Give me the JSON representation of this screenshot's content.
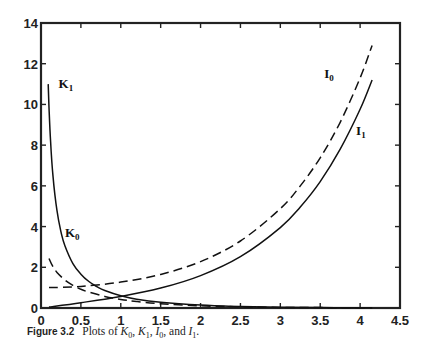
{
  "chart_data": {
    "type": "line",
    "title": "",
    "xlabel": "",
    "ylabel": "",
    "xlim": [
      0,
      4.5
    ],
    "ylim": [
      0,
      14
    ],
    "grid": false,
    "legend": "inline labels",
    "xticks": [
      0,
      0.5,
      1,
      1.5,
      2,
      2.5,
      3,
      3.5,
      4,
      4.5
    ],
    "xtick_labels": [
      "0",
      "0.5",
      "1",
      "1.5",
      "2",
      "2.5",
      "3",
      "3.5",
      "4",
      "4.5"
    ],
    "yticks": [
      0,
      2,
      4,
      6,
      8,
      10,
      12,
      14
    ],
    "ytick_labels": [
      "0",
      "2",
      "4",
      "6",
      "8",
      "10",
      "12",
      "14"
    ],
    "series": [
      {
        "name": "K1",
        "label_main": "K",
        "label_sub": "1",
        "style": "solid",
        "label_pos": [
          0.22,
          10.8
        ],
        "x": [
          0.09,
          0.1,
          0.12,
          0.15,
          0.2,
          0.25,
          0.3,
          0.4,
          0.5,
          0.6,
          0.7,
          0.8,
          1.0,
          1.2,
          1.5,
          2.0,
          2.5,
          3.0,
          3.5,
          4.0,
          4.15
        ],
        "values": [
          11.0,
          9.85,
          8.18,
          6.48,
          4.78,
          3.75,
          3.06,
          2.18,
          1.66,
          1.3,
          1.05,
          0.86,
          0.6,
          0.43,
          0.28,
          0.14,
          0.07,
          0.04,
          0.02,
          0.01,
          0.01
        ]
      },
      {
        "name": "K0",
        "label_main": "K",
        "label_sub": "0",
        "style": "dashed",
        "label_pos": [
          0.3,
          3.5
        ],
        "x": [
          0.1,
          0.15,
          0.2,
          0.3,
          0.4,
          0.5,
          0.6,
          0.8,
          1.0,
          1.2,
          1.5,
          2.0,
          2.5,
          3.0,
          3.5,
          4.0,
          4.15
        ],
        "values": [
          2.43,
          2.03,
          1.75,
          1.37,
          1.11,
          0.92,
          0.78,
          0.57,
          0.42,
          0.32,
          0.21,
          0.11,
          0.06,
          0.03,
          0.02,
          0.01,
          0.01
        ]
      },
      {
        "name": "I0",
        "label_main": "I",
        "label_sub": "0",
        "style": "dashed",
        "label_pos": [
          3.55,
          11.3
        ],
        "x": [
          0.1,
          0.5,
          1.0,
          1.5,
          2.0,
          2.5,
          3.0,
          3.25,
          3.5,
          3.75,
          4.0,
          4.15
        ],
        "values": [
          1.0,
          1.06,
          1.27,
          1.65,
          2.28,
          3.29,
          4.88,
          6.0,
          7.38,
          9.12,
          11.3,
          12.9
        ]
      },
      {
        "name": "I1",
        "label_main": "I",
        "label_sub": "1",
        "style": "solid",
        "label_pos": [
          3.95,
          8.5
        ],
        "x": [
          0.1,
          0.5,
          1.0,
          1.5,
          2.0,
          2.5,
          3.0,
          3.25,
          3.5,
          3.75,
          4.0,
          4.15
        ],
        "values": [
          0.05,
          0.26,
          0.57,
          0.98,
          1.59,
          2.52,
          3.95,
          4.96,
          6.21,
          7.8,
          9.76,
          11.2
        ]
      }
    ]
  },
  "caption": {
    "figure": "Figure 3.2",
    "text_prefix": "Plots of ",
    "text": "Plots of K0, K1, I0, and I1."
  }
}
